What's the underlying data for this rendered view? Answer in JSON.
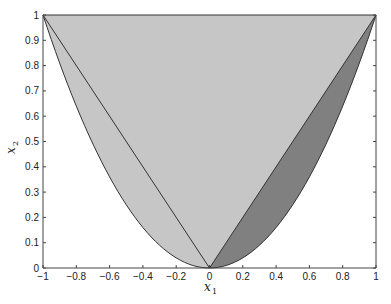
{
  "chart_data": {
    "type": "area",
    "title": "",
    "xlabel": "x1",
    "ylabel": "x2",
    "xlim": [
      -1,
      1
    ],
    "ylim": [
      0,
      1
    ],
    "grid": false,
    "legend": null,
    "x_ticks": [
      -1,
      -0.8,
      -0.6,
      -0.4,
      -0.2,
      0,
      0.2,
      0.4,
      0.6,
      0.8,
      1
    ],
    "x_tick_labels": [
      "-1",
      "-0.8",
      "-0.6",
      "-0.4",
      "-0.2",
      "0",
      "0.2",
      "0.4",
      "0.6",
      "0.8",
      "1"
    ],
    "y_ticks": [
      0,
      0.1,
      0.2,
      0.3,
      0.4,
      0.5,
      0.6,
      0.7,
      0.8,
      0.9,
      1
    ],
    "y_tick_labels": [
      "0",
      "0.1",
      "0.2",
      "0.3",
      "0.4",
      "0.5",
      "0.6",
      "0.7",
      "0.8",
      "0.9",
      "1"
    ],
    "regions": [
      {
        "name": "epigraph-of-parabola",
        "description": "Region above x2 = x1^2 and below x2 = 1",
        "boundary": "x2 = x1^2",
        "upper": "x2 = 1",
        "x_range": [
          -1,
          1
        ],
        "fill": "#c6c6c6"
      },
      {
        "name": "lens-between-line-and-parabola",
        "description": "Region between x2 = x1 (above) and x2 = x1^2 (below)",
        "upper": "x2 = x1",
        "lower": "x2 = x1^2",
        "x_range": [
          0,
          1
        ],
        "fill": "#808080"
      }
    ],
    "lines": [
      {
        "name": "left-segment",
        "points": [
          [
            -1,
            1
          ],
          [
            0,
            0
          ]
        ]
      },
      {
        "name": "right-segment",
        "points": [
          [
            0,
            0
          ],
          [
            1,
            1
          ]
        ]
      },
      {
        "name": "top-edge",
        "points": [
          [
            -1,
            1
          ],
          [
            1,
            1
          ]
        ]
      },
      {
        "name": "parabola",
        "equation": "x2 = x1^2",
        "x_range": [
          -1,
          1
        ]
      }
    ]
  },
  "labels": {
    "xlabel_main": "x",
    "xlabel_sub": "1",
    "ylabel_main": "x",
    "ylabel_sub": "2"
  },
  "colors": {
    "light_region": "#c6c6c6",
    "dark_region": "#808080",
    "stroke": "#333333",
    "axis": "#444444"
  }
}
